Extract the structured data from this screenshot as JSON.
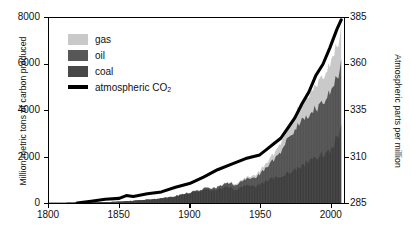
{
  "chart_data": {
    "type": "area",
    "title": "",
    "xlabel": "",
    "ylabel": "Million metric tons of carbon produced",
    "ylabel_right": "Atmospheric parts per million",
    "xlim": [
      1800,
      2010
    ],
    "ylim": [
      0,
      8000
    ],
    "ylim_right": [
      285,
      385
    ],
    "xticks": [
      1800,
      1850,
      1900,
      1950,
      2000
    ],
    "yticks": [
      0,
      2000,
      4000,
      6000,
      8000
    ],
    "yticks_right": [
      285,
      310,
      335,
      360,
      385
    ],
    "grid": false,
    "legend_position": "upper-left",
    "stacked": true,
    "colors": {
      "gas": "#c9c9c9",
      "oil": "#575757",
      "coal": "#484848",
      "co2_line": "#000000"
    },
    "series": [
      {
        "name": "coal",
        "label": "coal",
        "color": "#484848",
        "unit": "million metric tons of carbon",
        "x": [
          1800,
          1810,
          1820,
          1830,
          1840,
          1850,
          1860,
          1870,
          1880,
          1890,
          1900,
          1905,
          1910,
          1913,
          1918,
          1920,
          1925,
          1929,
          1932,
          1935,
          1938,
          1941,
          1944,
          1946,
          1950,
          1955,
          1960,
          1963,
          1966,
          1969,
          1972,
          1975,
          1978,
          1981,
          1984,
          1987,
          1990,
          1993,
          1996,
          1999,
          2002,
          2005,
          2008
        ],
        "values": [
          8,
          14,
          20,
          28,
          42,
          62,
          95,
          140,
          200,
          290,
          420,
          480,
          540,
          610,
          520,
          580,
          650,
          700,
          560,
          620,
          700,
          760,
          800,
          700,
          820,
          950,
          1060,
          1150,
          1220,
          1280,
          1350,
          1420,
          1500,
          1650,
          1780,
          1900,
          2000,
          2050,
          2160,
          2220,
          2450,
          2800,
          3150
        ]
      },
      {
        "name": "oil",
        "label": "oil",
        "color": "#575757",
        "unit": "million metric tons of carbon",
        "x": [
          1800,
          1850,
          1870,
          1880,
          1890,
          1900,
          1910,
          1920,
          1930,
          1940,
          1950,
          1955,
          1960,
          1965,
          1970,
          1975,
          1980,
          1985,
          1990,
          1995,
          2000,
          2005,
          2008
        ],
        "values": [
          0,
          0,
          2,
          6,
          14,
          30,
          60,
          110,
          190,
          260,
          430,
          580,
          800,
          1080,
          1500,
          1700,
          2000,
          1900,
          2150,
          2300,
          2500,
          2650,
          2750
        ]
      },
      {
        "name": "gas",
        "label": "gas",
        "color": "#c9c9c9",
        "unit": "million metric tons of carbon",
        "x": [
          1800,
          1850,
          1880,
          1900,
          1920,
          1930,
          1940,
          1950,
          1960,
          1970,
          1980,
          1990,
          2000,
          2008
        ],
        "values": [
          0,
          0,
          1,
          5,
          20,
          40,
          70,
          130,
          260,
          500,
          750,
          1000,
          1250,
          1450
        ]
      },
      {
        "name": "atmospheric CO2",
        "label": "atmospheric CO₂",
        "color": "#000000",
        "axis": "right",
        "unit": "parts per million",
        "x": [
          1820,
          1830,
          1840,
          1850,
          1855,
          1860,
          1870,
          1880,
          1890,
          1900,
          1910,
          1920,
          1930,
          1940,
          1950,
          1955,
          1960,
          1965,
          1970,
          1975,
          1980,
          1985,
          1990,
          1995,
          2000,
          2005,
          2008
        ],
        "values": [
          285,
          286,
          287,
          287.5,
          289,
          288.5,
          290,
          291,
          293.5,
          295.5,
          299,
          303,
          306,
          309,
          311,
          314,
          317,
          320,
          325.5,
          331,
          338.5,
          345,
          354,
          360,
          369,
          379,
          384
        ]
      }
    ]
  },
  "legend": {
    "items": [
      {
        "key": "gas",
        "label": "gas",
        "type": "swatch"
      },
      {
        "key": "oil",
        "label": "oil",
        "type": "swatch"
      },
      {
        "key": "coal",
        "label": "coal",
        "type": "swatch"
      },
      {
        "key": "co2",
        "label": "atmospheric CO",
        "sub": "2",
        "type": "line"
      }
    ]
  }
}
